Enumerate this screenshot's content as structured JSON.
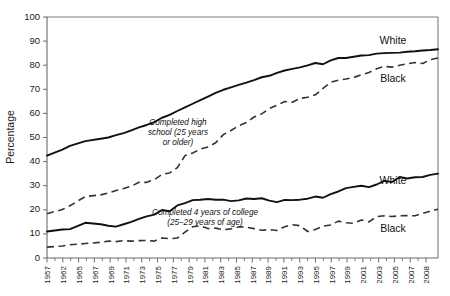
{
  "chart_data": {
    "type": "line",
    "title": "",
    "xlabel": "",
    "ylabel": "Percentage",
    "ylim": [
      0,
      100
    ],
    "ytick_step": 10,
    "yticks": [
      "0",
      "10",
      "20",
      "30",
      "40",
      "50",
      "60",
      "70",
      "80",
      "90",
      "100"
    ],
    "grid": false,
    "legend_position": "inline-right",
    "x": [
      1957,
      1959,
      1960,
      1962,
      1964,
      1965,
      1966,
      1967,
      1968,
      1969,
      1970,
      1971,
      1972,
      1973,
      1974,
      1975,
      1976,
      1977,
      1978,
      1979,
      1980,
      1981,
      1982,
      1983,
      1984,
      1985,
      1986,
      1987,
      1988,
      1989,
      1990,
      1991,
      1992,
      1993,
      1994,
      1995,
      1996,
      1997,
      1998,
      1999,
      2000,
      2001,
      2002,
      2003,
      2004,
      2005,
      2006,
      2007,
      2008
    ],
    "xtick_labels": [
      "1957",
      "1962",
      "1965",
      "1967",
      "1969",
      "1971",
      "1973",
      "1975",
      "1977",
      "1979",
      "1981",
      "1983",
      "1985",
      "1987",
      "1989",
      "1991",
      "1993",
      "1995",
      "1997",
      "1999",
      "2001",
      "2003",
      "2005",
      "2007",
      "2008"
    ],
    "series": [
      {
        "name": "White, completed high school (25 years or older)",
        "label": "White",
        "style": "solid",
        "group": "high-school",
        "values": [
          42.5,
          45.0,
          46.5,
          48.5,
          49.5,
          50.0,
          51.0,
          51.8,
          53.0,
          54.2,
          55.2,
          56.4,
          58.2,
          59.4,
          61.0,
          62.5,
          64.0,
          65.5,
          67.0,
          68.5,
          69.8,
          70.8,
          71.8,
          72.8,
          73.8,
          75.0,
          75.6,
          76.8,
          77.8,
          78.5,
          79.1,
          79.9,
          80.9,
          80.4,
          82.0,
          83.0,
          83.0,
          83.5,
          84.0,
          84.2,
          84.8,
          85.0,
          85.1,
          85.2,
          85.6,
          85.8,
          86.1,
          86.3,
          86.6
        ]
      },
      {
        "name": "Black, completed high school (25 years or older)",
        "label": "Black",
        "style": "dashed",
        "group": "high-school",
        "values": [
          18.4,
          20.1,
          21.7,
          25.5,
          26.2,
          27.0,
          28.0,
          28.8,
          29.8,
          31.4,
          31.4,
          32.5,
          34.7,
          35.3,
          37.5,
          42.5,
          43.6,
          45.2,
          46.1,
          47.8,
          51.2,
          52.9,
          54.9,
          56.2,
          58.5,
          59.8,
          62.0,
          63.4,
          64.9,
          64.6,
          66.2,
          66.7,
          67.7,
          70.4,
          72.9,
          73.8,
          74.3,
          74.9,
          76.0,
          77.0,
          78.5,
          79.5,
          79.2,
          80.0,
          80.6,
          81.1,
          80.7,
          82.3,
          83.0
        ]
      },
      {
        "name": "White, completed 4 years of college (25-29 years of age)",
        "label": "White",
        "style": "solid",
        "group": "college",
        "values": [
          11.0,
          11.8,
          12.0,
          14.6,
          14.0,
          13.4,
          13.0,
          14.0,
          15.0,
          16.2,
          17.3,
          18.0,
          19.9,
          19.4,
          21.8,
          22.8,
          24.0,
          24.2,
          24.5,
          24.2,
          24.2,
          23.6,
          23.9,
          24.7,
          24.5,
          24.8,
          23.8,
          23.2,
          24.1,
          24.0,
          24.2,
          24.6,
          25.5,
          25.0,
          26.5,
          27.6,
          29.0,
          29.5,
          30.0,
          29.4,
          30.5,
          32.0,
          31.5,
          33.6,
          33.0,
          33.5,
          33.6,
          34.5,
          35.0
        ]
      },
      {
        "name": "Black, completed 4 years of college (25-29 years of age)",
        "label": "Black",
        "style": "dashed",
        "group": "college",
        "values": [
          4.5,
          5.0,
          5.5,
          6.0,
          6.5,
          7.0,
          6.8,
          7.2,
          7.0,
          7.2,
          7.3,
          7.0,
          8.3,
          8.0,
          8.3,
          10.7,
          13.0,
          13.4,
          12.2,
          12.4,
          11.7,
          12.1,
          12.9,
          12.8,
          12.2,
          11.5,
          11.8,
          11.4,
          13.0,
          13.8,
          13.4,
          11.0,
          11.8,
          13.2,
          13.7,
          15.3,
          14.6,
          14.4,
          15.8,
          15.0,
          17.2,
          17.5,
          17.2,
          17.5,
          17.6,
          17.5,
          18.5,
          19.5,
          20.2
        ]
      }
    ],
    "annotations": [
      {
        "id": "annotation-high-school",
        "lines": [
          "Completed high",
          "school (25 years",
          "or older)"
        ]
      },
      {
        "id": "annotation-college",
        "lines": [
          "Completed 4 years of college",
          "(25–29 years of age)"
        ]
      }
    ],
    "series_labels": [
      {
        "id": "label-hs-white",
        "text": "White"
      },
      {
        "id": "label-hs-black",
        "text": "Black"
      },
      {
        "id": "label-col-white",
        "text": "White"
      },
      {
        "id": "label-col-black",
        "text": "Black"
      }
    ],
    "colors": {
      "solid_line": "#111111",
      "dashed_line": "#333333",
      "axis": "#6b6b6b",
      "text": "#1a1a1a",
      "background": "#ffffff"
    }
  }
}
